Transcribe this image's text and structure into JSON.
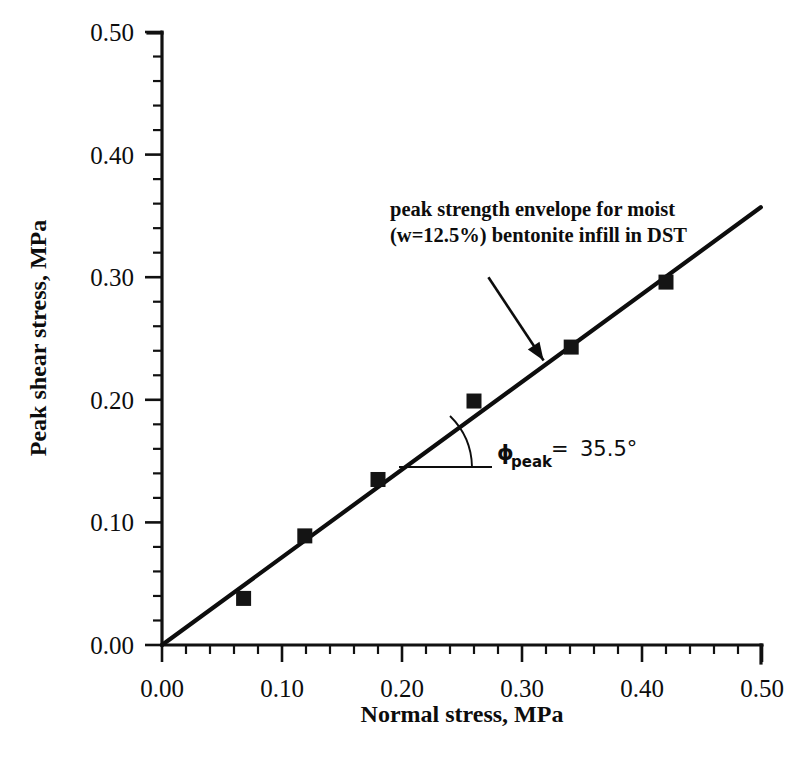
{
  "chart_data": {
    "type": "scatter",
    "title": "",
    "xlabel": "Normal stress, MPa",
    "ylabel": "Peak shear stress, MPa",
    "xlim": [
      0.0,
      0.5
    ],
    "ylim": [
      0.0,
      0.5
    ],
    "xticks": [
      "0.00",
      "0.10",
      "0.20",
      "0.30",
      "0.40",
      "0.50"
    ],
    "xtick_values": [
      0.0,
      0.1,
      0.2,
      0.3,
      0.4,
      0.5
    ],
    "yticks": [
      "0.00",
      "0.10",
      "0.20",
      "0.30",
      "0.40",
      "0.50"
    ],
    "ytick_values": [
      0.0,
      0.1,
      0.2,
      0.3,
      0.4,
      0.5
    ],
    "minor_tick_step": 0.02,
    "grid": false,
    "legend": "none",
    "series": [
      {
        "name": "Peak strength data points",
        "marker": "filled-square",
        "color": "#141414",
        "points": [
          {
            "x": 0.068,
            "y": 0.038
          },
          {
            "x": 0.119,
            "y": 0.089
          },
          {
            "x": 0.18,
            "y": 0.135
          },
          {
            "x": 0.26,
            "y": 0.199
          },
          {
            "x": 0.341,
            "y": 0.243
          },
          {
            "x": 0.42,
            "y": 0.296
          }
        ]
      },
      {
        "name": "Peak strength envelope",
        "marker": "none",
        "color": "#0d0d0d",
        "line": {
          "x0": 0.0,
          "y0": 0.0,
          "x1": 0.499,
          "y1": 0.357
        },
        "slope_deg": 35.5,
        "intercept": 0.0
      }
    ],
    "annotations": [
      {
        "name": "envelope-callout",
        "line1": "peak strength envelope for moist",
        "line2": "(w=12.5%) bentonite infill in DST",
        "arrow_from": {
          "x": 0.272,
          "y": 0.3
        },
        "arrow_to": {
          "x": 0.318,
          "y": 0.232
        }
      },
      {
        "name": "friction-angle",
        "symbol": "ϕ",
        "subscript": "peak",
        "equals": "=",
        "value": "35.5°"
      }
    ]
  }
}
